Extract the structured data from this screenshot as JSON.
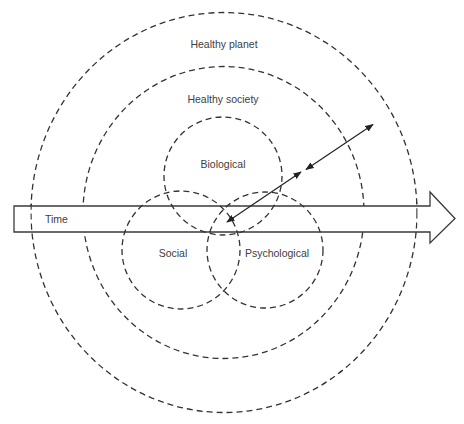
{
  "diagram": {
    "labels": {
      "outer_ring": "Healthy planet",
      "middle_ring": "Healthy society",
      "biological": "Biological",
      "social": "Social",
      "psychological": "Psychological",
      "time_arrow": "Time"
    },
    "elements": [
      {
        "id": "healthy-planet-ring",
        "type": "dashed-circle",
        "label": "Healthy planet"
      },
      {
        "id": "healthy-society-ring",
        "type": "dashed-circle",
        "label": "Healthy society"
      },
      {
        "id": "biological-circle",
        "type": "dashed-circle",
        "label": "Biological"
      },
      {
        "id": "social-circle",
        "type": "dashed-circle",
        "label": "Social"
      },
      {
        "id": "psychological-circle",
        "type": "dashed-circle",
        "label": "Psychological"
      },
      {
        "id": "time-arrow",
        "type": "block-arrow",
        "label": "Time",
        "direction": "right"
      },
      {
        "id": "inner-double-arrow",
        "type": "double-headed-arrow",
        "connects": [
          "individual core",
          "healthy society"
        ]
      },
      {
        "id": "outer-double-arrow",
        "type": "double-headed-arrow",
        "connects": [
          "healthy society",
          "healthy planet"
        ]
      }
    ],
    "colors": {
      "line": "#333333",
      "text": "#404040",
      "background": "#ffffff"
    }
  }
}
